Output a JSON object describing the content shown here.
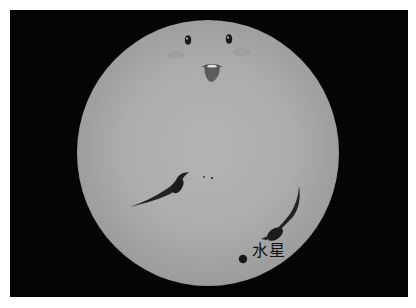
{
  "scene": {
    "description": "Transit of Mercury across the Sun with a cartoon face",
    "background_color": "#050505",
    "sun_color": "#acacac"
  },
  "labels": {
    "mercury": "水星"
  },
  "features": {
    "eyes": [
      {
        "x": 188,
        "y": 40
      },
      {
        "x": 229,
        "y": 39
      }
    ],
    "mouth": {
      "x": 212,
      "y": 71
    },
    "cheeks": [
      {
        "x": 176,
        "y": 55
      },
      {
        "x": 242,
        "y": 52
      }
    ],
    "sunspot_dots": [
      {
        "x": 204,
        "y": 177
      },
      {
        "x": 212,
        "y": 178
      }
    ],
    "mercury_dot": {
      "x": 243,
      "y": 259
    }
  }
}
